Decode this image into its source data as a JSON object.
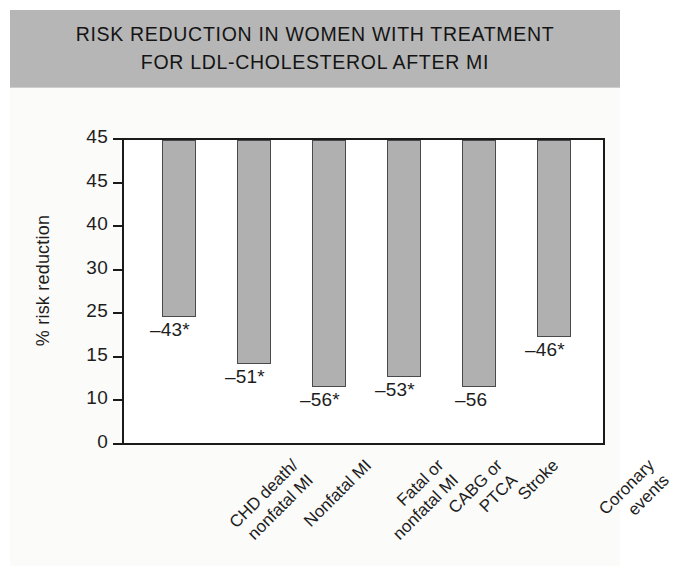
{
  "title": "RISK REDUCTION IN WOMEN WITH TREATMENT\nFOR LDL-CHOLESTEROL AFTER MI",
  "axis": {
    "ylabel": "% risk reduction"
  },
  "colors": {
    "banner": "#b6b6b6",
    "bar_fill": "#b0b0b0",
    "bar_stroke": "#4a4a4a",
    "axis": "#1a1a1a",
    "text": "#1d1d1d",
    "plot_background": "#ffffff"
  },
  "chart_data": {
    "type": "bar",
    "title": "RISK REDUCTION IN WOMEN WITH TREATMENT FOR LDL-CHOLESTEROL AFTER MI",
    "xlabel": "",
    "ylabel": "% risk reduction",
    "grid": false,
    "legend": "none",
    "ytick_labels": [
      "45",
      "45",
      "40",
      "30",
      "25",
      "15",
      "10",
      "0"
    ],
    "ytick_values": [
      45,
      45,
      40,
      30,
      25,
      15,
      10,
      0
    ],
    "ylim": [
      0,
      45
    ],
    "categories": [
      "CHD death/\nnonfatal MI",
      "Nonfatal MI",
      "Fatal or\nnonfatal MI",
      "CABG or\nPTCA",
      "Stroke",
      "Coronary\nevents"
    ],
    "values": [
      -43,
      -51,
      -56,
      -53,
      -56,
      -46
    ],
    "data_labels": [
      "–43*",
      "–51*",
      "–56*",
      "–53*",
      "–56",
      "–46*"
    ],
    "bars_px": [
      {
        "left": 38,
        "width": 34,
        "top": 0,
        "height": 177,
        "value_left": 28,
        "value_top": 181
      },
      {
        "left": 113,
        "width": 34,
        "top": 0,
        "height": 224,
        "value_left": 103,
        "value_top": 228
      },
      {
        "left": 188,
        "width": 34,
        "top": 0,
        "height": 247,
        "value_left": 178,
        "value_top": 251
      },
      {
        "left": 263,
        "width": 34,
        "top": 0,
        "height": 237,
        "value_left": 253,
        "value_top": 241
      },
      {
        "left": 338,
        "width": 34,
        "top": 0,
        "height": 247,
        "value_left": 333,
        "value_top": 251
      },
      {
        "left": 413,
        "width": 34,
        "top": 0,
        "height": 197,
        "value_left": 403,
        "value_top": 201
      }
    ]
  }
}
